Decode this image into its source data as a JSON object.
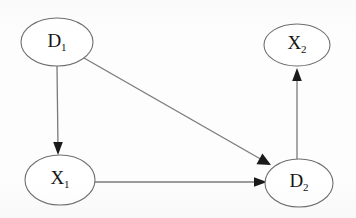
{
  "diagram": {
    "type": "directed-graph",
    "title": "",
    "background_color": "#fdfdfd",
    "node_stroke_color": "#6e6e6e",
    "edge_color": "#7a7a7a",
    "arrowhead_color": "#1a1a1a",
    "label_color": "#141414",
    "nodes": [
      {
        "id": "D1",
        "base": "D",
        "subscript": "1",
        "label": "D1",
        "cx": 57,
        "cy": 42,
        "rx": 36,
        "ry": 24
      },
      {
        "id": "X2",
        "base": "X",
        "subscript": "2",
        "label": "X2",
        "cx": 297,
        "cy": 45,
        "rx": 33,
        "ry": 21
      },
      {
        "id": "X1",
        "base": "X",
        "subscript": "1",
        "label": "X1",
        "cx": 60,
        "cy": 180,
        "rx": 35,
        "ry": 25
      },
      {
        "id": "D2",
        "base": "D",
        "subscript": "2",
        "label": "D2",
        "cx": 299,
        "cy": 183,
        "rx": 34,
        "ry": 24
      }
    ],
    "edges": [
      {
        "id": "D1-to-X1",
        "from": "D1",
        "to": "X1",
        "orientation": "vertical",
        "x1": 57,
        "y1": 66,
        "x2": 58,
        "y2": 152
      },
      {
        "id": "D1-to-D2",
        "from": "D1",
        "to": "D2",
        "orientation": "diagonal",
        "x1": 84,
        "y1": 58,
        "x2": 270,
        "y2": 164
      },
      {
        "id": "X1-to-D2",
        "from": "X1",
        "to": "D2",
        "orientation": "horizontal",
        "x1": 95,
        "y1": 182,
        "x2": 266,
        "y2": 182
      },
      {
        "id": "D2-to-X2",
        "from": "D2",
        "to": "X2",
        "orientation": "vertical",
        "x1": 297,
        "y1": 159,
        "x2": 297,
        "y2": 69
      }
    ]
  }
}
